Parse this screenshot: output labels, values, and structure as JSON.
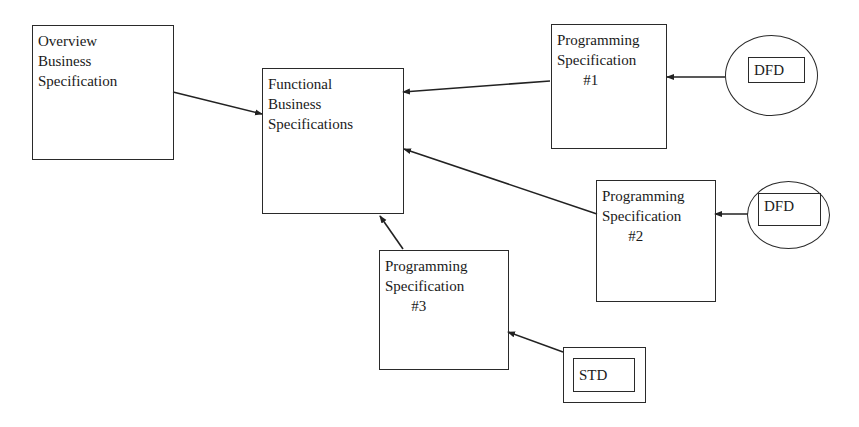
{
  "diagram": {
    "nodes": {
      "overview": {
        "label": "Overview\nBusiness\nSpecification"
      },
      "functional": {
        "label": "Functional\nBusiness\nSpecifications"
      },
      "prog1": {
        "label": "Programming\nSpecification\n       #1"
      },
      "prog2": {
        "label": "Programming\nSpecification\n       #2"
      },
      "prog3": {
        "label": "Programming\nSpecification\n       #3"
      },
      "dfd1": {
        "label": "DFD",
        "shape": "circle-with-box"
      },
      "dfd2": {
        "label": "DFD",
        "shape": "circle-with-box"
      },
      "std": {
        "label": "STD",
        "shape": "double-box"
      }
    },
    "edges": [
      {
        "from": "overview",
        "to": "functional"
      },
      {
        "from": "prog1",
        "to": "functional"
      },
      {
        "from": "prog2",
        "to": "functional"
      },
      {
        "from": "prog3",
        "to": "functional"
      },
      {
        "from": "dfd1",
        "to": "prog1"
      },
      {
        "from": "dfd2",
        "to": "prog2"
      },
      {
        "from": "std",
        "to": "prog3"
      }
    ],
    "colors": {
      "stroke": "#2a2a2a",
      "background": "#ffffff"
    }
  }
}
